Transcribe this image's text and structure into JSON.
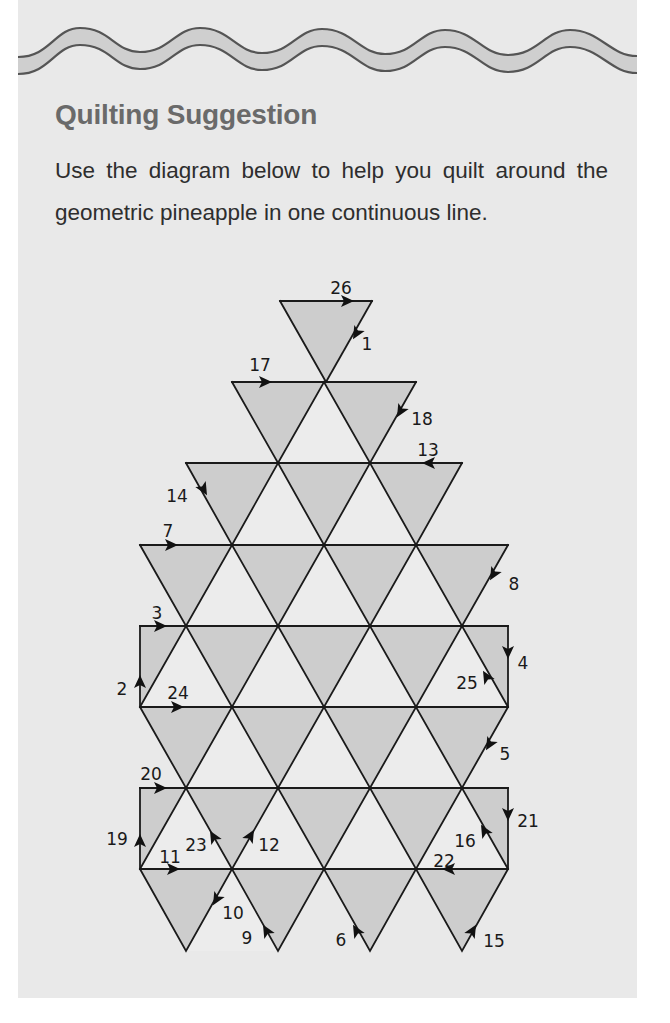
{
  "header": {
    "title": "Quilting Suggestion",
    "description": "Use the diagram below to help you quilt around the geometric pineapple in one continuous line."
  },
  "colors": {
    "page_background": "#e9e9e9",
    "wave_fill": "#cfcfcf",
    "wave_stroke": "#555555",
    "heading": "#6a6a6a",
    "body_text": "#2e2e2e",
    "triangle_shaded": "#cdcdcd",
    "triangle_unshaded": "#ececec",
    "line": "#1a1a1a"
  },
  "diagram": {
    "subject": "geometric pineapple",
    "grid": {
      "columns_x": [
        140,
        186,
        232,
        278,
        324,
        370,
        416,
        462,
        508
      ],
      "rows_y": [
        301,
        382,
        463,
        545,
        626,
        707,
        788,
        869,
        951
      ]
    },
    "quilting_path_steps": [
      {
        "step": 1,
        "label": "1",
        "arrow": {
          "x": 356,
          "y": 334,
          "angle": 120
        },
        "text": {
          "x": 367,
          "y": 345
        }
      },
      {
        "step": 2,
        "label": "2",
        "arrow": {
          "x": 140,
          "y": 681,
          "angle": -90
        },
        "text": {
          "x": 122,
          "y": 690
        }
      },
      {
        "step": 3,
        "label": "3",
        "arrow": {
          "x": 161,
          "y": 626,
          "angle": 0
        },
        "text": {
          "x": 157,
          "y": 614
        }
      },
      {
        "step": 4,
        "label": "4",
        "arrow": {
          "x": 508,
          "y": 653,
          "angle": 90
        },
        "text": {
          "x": 523,
          "y": 664
        }
      },
      {
        "step": 5,
        "label": "5",
        "arrow": {
          "x": 489,
          "y": 745,
          "angle": 120
        },
        "text": {
          "x": 505,
          "y": 755
        }
      },
      {
        "step": 6,
        "label": "6",
        "arrow": {
          "x": 356,
          "y": 930,
          "angle": -120
        },
        "text": {
          "x": 341,
          "y": 941
        }
      },
      {
        "step": 7,
        "label": "7",
        "arrow": {
          "x": 172,
          "y": 545,
          "angle": 0
        },
        "text": {
          "x": 168,
          "y": 532
        }
      },
      {
        "step": 8,
        "label": "8",
        "arrow": {
          "x": 493,
          "y": 575,
          "angle": 120
        },
        "text": {
          "x": 514,
          "y": 585
        }
      },
      {
        "step": 9,
        "label": "9",
        "arrow": {
          "x": 266,
          "y": 930,
          "angle": -120
        },
        "text": {
          "x": 247,
          "y": 939
        }
      },
      {
        "step": 10,
        "label": "10",
        "arrow": {
          "x": 216,
          "y": 900,
          "angle": 120
        },
        "text": {
          "x": 233,
          "y": 914
        }
      },
      {
        "step": 11,
        "label": "11",
        "arrow": {
          "x": 174,
          "y": 869,
          "angle": 0
        },
        "text": {
          "x": 170,
          "y": 858
        }
      },
      {
        "step": 12,
        "label": "12",
        "arrow": {
          "x": 251,
          "y": 835,
          "angle": -60
        },
        "text": {
          "x": 269,
          "y": 846
        }
      },
      {
        "step": 13,
        "label": "13",
        "arrow": {
          "x": 428,
          "y": 463,
          "angle": 180
        },
        "text": {
          "x": 428,
          "y": 451
        }
      },
      {
        "step": 14,
        "label": "14",
        "arrow": {
          "x": 204,
          "y": 490,
          "angle": 60
        },
        "text": {
          "x": 177,
          "y": 497
        }
      },
      {
        "step": 15,
        "label": "15",
        "arrow": {
          "x": 473,
          "y": 930,
          "angle": -60
        },
        "text": {
          "x": 494,
          "y": 942
        }
      },
      {
        "step": 16,
        "label": "16",
        "arrow": {
          "x": 484,
          "y": 830,
          "angle": -120
        },
        "text": {
          "x": 465,
          "y": 842
        }
      },
      {
        "step": 17,
        "label": "17",
        "arrow": {
          "x": 266,
          "y": 382,
          "angle": 0
        },
        "text": {
          "x": 260,
          "y": 366
        }
      },
      {
        "step": 18,
        "label": "18",
        "arrow": {
          "x": 400,
          "y": 412,
          "angle": 120
        },
        "text": {
          "x": 422,
          "y": 420
        }
      },
      {
        "step": 19,
        "label": "19",
        "arrow": {
          "x": 140,
          "y": 840,
          "angle": -90
        },
        "text": {
          "x": 117,
          "y": 840
        }
      },
      {
        "step": 20,
        "label": "20",
        "arrow": {
          "x": 161,
          "y": 788,
          "angle": 0
        },
        "text": {
          "x": 151,
          "y": 775
        }
      },
      {
        "step": 21,
        "label": "21",
        "arrow": {
          "x": 508,
          "y": 815,
          "angle": 90
        },
        "text": {
          "x": 528,
          "y": 822
        }
      },
      {
        "step": 22,
        "label": "22",
        "arrow": {
          "x": 448,
          "y": 869,
          "angle": 180
        },
        "text": {
          "x": 444,
          "y": 862
        }
      },
      {
        "step": 23,
        "label": "23",
        "arrow": {
          "x": 213,
          "y": 836,
          "angle": -120
        },
        "text": {
          "x": 196,
          "y": 846
        }
      },
      {
        "step": 24,
        "label": "24",
        "arrow": {
          "x": 178,
          "y": 707,
          "angle": 0
        },
        "text": {
          "x": 178,
          "y": 694
        }
      },
      {
        "step": 25,
        "label": "25",
        "arrow": {
          "x": 486,
          "y": 676,
          "angle": -120
        },
        "text": {
          "x": 467,
          "y": 684
        }
      },
      {
        "step": 26,
        "label": "26",
        "arrow": {
          "x": 348,
          "y": 301,
          "angle": 0
        },
        "text": {
          "x": 341,
          "y": 289
        }
      }
    ]
  }
}
